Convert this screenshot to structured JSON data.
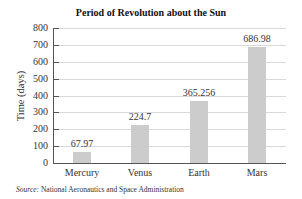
{
  "chart_data": {
    "type": "bar",
    "title": "Period of Revolution about the Sun",
    "xlabel": "",
    "ylabel": "Time (days)",
    "categories": [
      "Mercury",
      "Venus",
      "Earth",
      "Mars"
    ],
    "values": [
      67.97,
      224.7,
      365.256,
      686.98
    ],
    "value_labels": [
      "67.97",
      "224.7",
      "365.256",
      "686.98"
    ],
    "ylim": [
      0,
      800
    ],
    "yticks": [
      0,
      100,
      200,
      300,
      400,
      500,
      600,
      700,
      800
    ],
    "grid": true,
    "legend": null,
    "bar_color": "#cccccc",
    "grid_color": "#d9d9d9"
  },
  "source": {
    "prefix": "Source:",
    "text": " National Aeronautics and Space Administration"
  }
}
